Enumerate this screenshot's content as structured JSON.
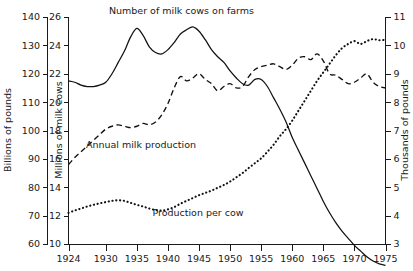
{
  "chart_data": {
    "type": "line",
    "title": "",
    "xlabel": "",
    "x_ticks": [
      1924,
      1930,
      1935,
      1940,
      1945,
      1950,
      1955,
      1960,
      1965,
      1970,
      1975
    ],
    "xlim": [
      1924,
      1975
    ],
    "grid": false,
    "legend": "inline-annotations",
    "axes": [
      {
        "id": "left-outer",
        "label": "Billions of pounds",
        "ticks": [
          60,
          70,
          80,
          90,
          100,
          110,
          120,
          130,
          140
        ],
        "lim": [
          60,
          140
        ],
        "position": "left",
        "series": "Annual milk production"
      },
      {
        "id": "left-inner",
        "label": "Millions of milk cows",
        "ticks": [
          10,
          12,
          14,
          16,
          18,
          20,
          22,
          24,
          26
        ],
        "lim": [
          10,
          26
        ],
        "position": "left",
        "series": "Number of milk cows on farms"
      },
      {
        "id": "right",
        "label": "Thousands of pounds",
        "ticks": [
          3,
          4,
          5,
          6,
          7,
          8,
          9,
          10,
          11
        ],
        "lim": [
          3,
          11
        ],
        "position": "right",
        "series": "Production per cow"
      }
    ],
    "series": [
      {
        "name": "Number of milk cows on farms",
        "style": "solid",
        "axis": "left-inner",
        "unit": "millions",
        "x": [
          1924,
          1925,
          1926,
          1927,
          1928,
          1929,
          1930,
          1931,
          1932,
          1933,
          1934,
          1935,
          1936,
          1937,
          1938,
          1939,
          1940,
          1941,
          1942,
          1943,
          1944,
          1945,
          1946,
          1947,
          1948,
          1949,
          1950,
          1951,
          1952,
          1953,
          1954,
          1955,
          1956,
          1957,
          1958,
          1959,
          1960,
          1961,
          1962,
          1963,
          1964,
          1965,
          1966,
          1967,
          1968,
          1969,
          1970,
          1971,
          1972,
          1973,
          1974,
          1975
        ],
        "values": [
          21.5,
          21.4,
          21.2,
          21.1,
          21.1,
          21.2,
          21.4,
          22.0,
          22.8,
          23.6,
          24.6,
          25.2,
          24.7,
          23.9,
          23.5,
          23.4,
          23.7,
          24.2,
          24.8,
          25.1,
          25.3,
          25.0,
          24.4,
          23.7,
          23.2,
          22.8,
          22.2,
          21.7,
          21.3,
          21.2,
          21.6,
          21.6,
          21.1,
          20.3,
          19.5,
          18.6,
          17.5,
          16.6,
          15.7,
          14.8,
          13.9,
          13.0,
          12.2,
          11.5,
          10.9,
          10.4,
          9.9,
          9.5,
          9.1,
          8.8,
          8.6,
          8.5
        ]
      },
      {
        "name": "Annual milk production",
        "style": "dashed",
        "axis": "left-outer",
        "unit": "billions of pounds",
        "x": [
          1924,
          1925,
          1926,
          1927,
          1928,
          1929,
          1930,
          1931,
          1932,
          1933,
          1934,
          1935,
          1936,
          1937,
          1938,
          1939,
          1940,
          1941,
          1942,
          1943,
          1944,
          1945,
          1946,
          1947,
          1948,
          1949,
          1950,
          1951,
          1952,
          1953,
          1954,
          1955,
          1956,
          1957,
          1958,
          1959,
          1960,
          1961,
          1962,
          1963,
          1964,
          1965,
          1966,
          1967,
          1968,
          1969,
          1970,
          1971,
          1972,
          1973,
          1974,
          1975
        ],
        "values": [
          88.0,
          90.5,
          92.5,
          94.5,
          96.5,
          98.5,
          100.5,
          101.5,
          102.0,
          101.5,
          101.0,
          101.5,
          102.5,
          102.0,
          103.0,
          105.5,
          109.5,
          115.0,
          119.0,
          117.5,
          118.5,
          120.0,
          118.0,
          116.5,
          114.0,
          115.5,
          116.5,
          115.0,
          115.5,
          119.0,
          121.5,
          122.5,
          123.0,
          123.5,
          122.5,
          121.5,
          123.0,
          125.5,
          126.0,
          125.0,
          127.0,
          124.5,
          120.0,
          119.5,
          118.0,
          116.5,
          117.0,
          118.5,
          120.0,
          117.0,
          115.5,
          115.0
        ]
      },
      {
        "name": "Production per cow",
        "style": "dotted",
        "axis": "right",
        "unit": "thousands of pounds",
        "x": [
          1924,
          1925,
          1926,
          1927,
          1928,
          1929,
          1930,
          1931,
          1932,
          1933,
          1934,
          1935,
          1936,
          1937,
          1938,
          1939,
          1940,
          1941,
          1942,
          1943,
          1944,
          1945,
          1946,
          1947,
          1948,
          1949,
          1950,
          1951,
          1952,
          1953,
          1954,
          1955,
          1956,
          1957,
          1958,
          1959,
          1960,
          1961,
          1962,
          1963,
          1964,
          1965,
          1966,
          1967,
          1968,
          1969,
          1970,
          1971,
          1972,
          1973,
          1974,
          1975
        ],
        "values": [
          4.1,
          4.18,
          4.25,
          4.32,
          4.38,
          4.43,
          4.48,
          4.52,
          4.54,
          4.52,
          4.45,
          4.38,
          4.32,
          4.25,
          4.2,
          4.18,
          4.22,
          4.3,
          4.42,
          4.52,
          4.62,
          4.72,
          4.8,
          4.88,
          4.98,
          5.08,
          5.2,
          5.35,
          5.5,
          5.68,
          5.85,
          6.02,
          6.25,
          6.5,
          6.8,
          7.05,
          7.35,
          7.7,
          8.05,
          8.4,
          8.75,
          9.05,
          9.35,
          9.65,
          9.9,
          10.05,
          10.15,
          10.05,
          10.15,
          10.22,
          10.18,
          10.2
        ]
      }
    ],
    "annotations": [
      {
        "id": "label-cows",
        "text": "Number of milk cows on farms",
        "x": 1930.5,
        "y_axis": "left-inner",
        "y": 26.2
      },
      {
        "id": "label-production",
        "text": "Annual milk production",
        "x": 1926.8,
        "y_axis": "left-outer",
        "y": 94.0
      },
      {
        "id": "label-per-cow",
        "text": "Production per cow",
        "x": 1937.5,
        "y_axis": "right",
        "y": 4.0
      }
    ]
  }
}
